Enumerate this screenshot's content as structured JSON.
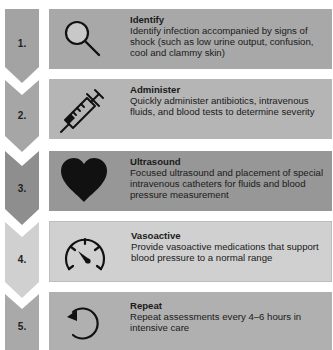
{
  "steps": [
    {
      "number": "1.",
      "title": "Identify",
      "description": "Identify infection accompanied by signs of shock (such as low urine output, confusion, cool and clammy skin)",
      "icon": "magnifying-glass-icon",
      "chevron_color": "#a3a3a3",
      "box_color": "#a8a8a8"
    },
    {
      "number": "2.",
      "title": "Administer",
      "description": "Quickly administer antibiotics, intravenous fluids, and blood tests to determine severity",
      "icon": "syringe-icon",
      "chevron_color": "#a6a6a6",
      "box_color": "#b5b5b5"
    },
    {
      "number": "3.",
      "title": "Ultrasound",
      "description": "Focused ultrasound and placement of special intravenous catheters for fluids and blood pressure measurement",
      "icon": "heart-icon",
      "chevron_color": "#8e8e8e",
      "box_color": "#979797"
    },
    {
      "number": "4.",
      "title": "Vasoactive",
      "description": "Provide vasoactive medications that support blood pressure to a normal range",
      "icon": "gauge-icon",
      "chevron_color": "#d0d0d0",
      "box_color": "#d0d0d0"
    },
    {
      "number": "5.",
      "title": "Repeat",
      "description": "Repeat assessments every 4–6 hours in intensive care",
      "icon": "repeat-arrow-icon",
      "chevron_color": "#a9a9a9",
      "box_color": "#b0b0b0"
    }
  ]
}
